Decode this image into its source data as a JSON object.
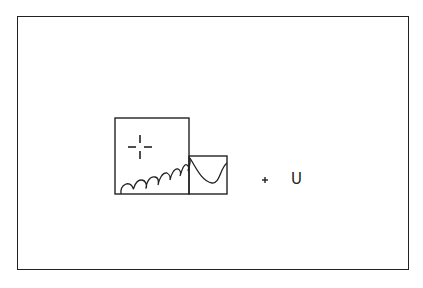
{
  "diagram": {
    "frame": {
      "x": 17,
      "y": 16,
      "width": 392,
      "height": 254
    },
    "large_box": {
      "x": 115,
      "y": 118,
      "width": 74,
      "height": 76
    },
    "small_box": {
      "x": 189,
      "y": 156,
      "width": 38,
      "height": 38
    },
    "crosshair": {
      "cx": 140,
      "cy": 147
    },
    "plus_marker": {
      "cx": 265,
      "cy": 180
    },
    "label": "U",
    "stroke_color": "#222222"
  }
}
